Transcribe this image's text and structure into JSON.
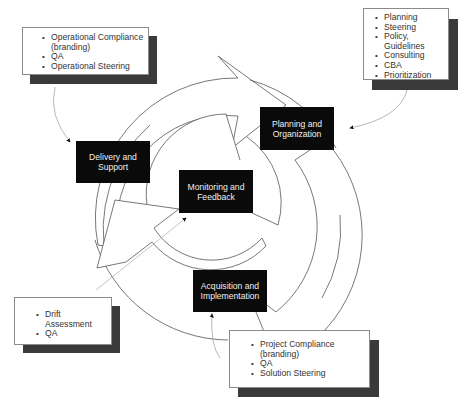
{
  "diagram": {
    "type": "cycle",
    "stages": [
      {
        "id": "planning",
        "label_line1": "Planning and",
        "label_line2": "Organization"
      },
      {
        "id": "acquisition",
        "label_line1": "Acquisition and",
        "label_line2": "Implementation"
      },
      {
        "id": "delivery",
        "label_line1": "Delivery and",
        "label_line2": "Support"
      },
      {
        "id": "monitoring",
        "label_line1": "Monitoring and",
        "label_line2": "Feedback"
      }
    ],
    "notes": {
      "delivery": {
        "items": [
          "Operational Compliance",
          "(branding)",
          "QA",
          "Operational Steering"
        ]
      },
      "planning": {
        "items": [
          "Planning",
          "Steering",
          "Policy, Guidelines",
          "Consulting",
          "CBA",
          "Prioritization"
        ]
      },
      "monitoring": {
        "items": [
          "Drift Assessment",
          "QA"
        ]
      },
      "acquisition": {
        "items": [
          "Project Compliance (branding)",
          "QA",
          "Solution Steering"
        ]
      }
    },
    "colors": {
      "stage_fill": "#0a0a0a",
      "stage_text": "#f0f0f0",
      "shadow": "#3a3a3a",
      "line": "#555555",
      "connector": "#999999"
    }
  }
}
